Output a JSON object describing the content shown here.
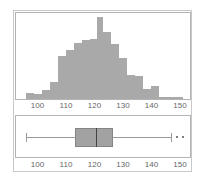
{
  "chart_data": [
    {
      "type": "bar",
      "subtype": "histogram",
      "title": "",
      "xlabel": "",
      "ylabel": "",
      "xlim": [
        93,
        155
      ],
      "x_ticks": [
        100,
        110,
        120,
        130,
        140,
        150
      ],
      "grid": false,
      "bin_width": 2.8,
      "bins_start": [
        96.0,
        98.8,
        101.6,
        104.4,
        107.2,
        110.0,
        112.8,
        115.6,
        118.4,
        120.8,
        123.0,
        125.8,
        128.6,
        131.4,
        134.2,
        137.0,
        139.8,
        142.6,
        145.4,
        148.2
      ],
      "values": [
        6.5,
        5,
        9,
        17,
        43,
        49,
        56,
        59,
        60,
        82,
        67,
        55,
        41,
        24,
        23,
        10,
        13,
        2,
        2,
        2
      ],
      "bar_color": "#a9a9a9"
    },
    {
      "type": "box",
      "orientation": "horizontal",
      "xlim": [
        93,
        155
      ],
      "x_ticks": [
        100,
        110,
        120,
        130,
        140,
        150
      ],
      "whisker_low": 96,
      "q1": 113,
      "median": 120.5,
      "q3": 126.5,
      "whisker_high": 147,
      "outliers": [
        149,
        151
      ],
      "box_color": "#a2a2a2"
    }
  ],
  "hist": {
    "tick_labels": [
      "100",
      "110",
      "120",
      "130",
      "140",
      "150"
    ]
  },
  "boxplot": {
    "tick_labels": [
      "100",
      "110",
      "120",
      "130",
      "140",
      "150"
    ]
  }
}
